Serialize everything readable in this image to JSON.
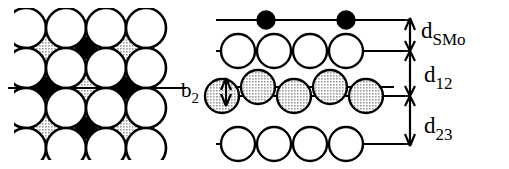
{
  "figure": {
    "kind": "crystal-surface-structure-diagram",
    "panels": [
      {
        "id": "top-view",
        "name": "top-view-panel",
        "description": "Top view of surface lattice: large open substrate circles with smaller octagonal adatom sites, some shaded gray and some filled black.",
        "rows": 5,
        "columns": 4,
        "cross_section_line": true
      },
      {
        "id": "side-view",
        "name": "side-view-panel",
        "description": "Side view cross-section showing four atomic layers with interlayer spacings and a buckled third layer.",
        "layers": [
          {
            "index": 1,
            "name": "sulfur-adatom-layer",
            "atom_style": "filled-black",
            "atom_count": 2,
            "buckled": false
          },
          {
            "index": 2,
            "name": "first-substrate-layer",
            "atom_style": "open-white",
            "atom_count": 4,
            "buckled": false
          },
          {
            "index": 3,
            "name": "second-substrate-layer",
            "atom_style": "shaded-gray",
            "atom_count": 5,
            "buckled": true
          },
          {
            "index": 4,
            "name": "third-substrate-layer",
            "atom_style": "open-white",
            "atom_count": 4,
            "buckled": false
          }
        ]
      }
    ]
  },
  "labels": {
    "d_smo": {
      "base": "d",
      "sub": "SMo",
      "full": "d_SMo",
      "meaning": "sulfur to molybdenum interlayer spacing"
    },
    "d_12": {
      "base": "d",
      "sub": "12",
      "full": "d_12",
      "meaning": "spacing between first and second substrate layers"
    },
    "d_23": {
      "base": "d",
      "sub": "23",
      "full": "d_23",
      "meaning": "spacing between second and third substrate layers"
    },
    "b_2": {
      "base": "b",
      "sub": "2",
      "full": "b_2",
      "meaning": "buckling amplitude of the second substrate layer"
    }
  },
  "colors": {
    "stroke": "#000000",
    "open_fill": "#ffffff",
    "shaded_fill": "#b4b4b4",
    "filled_fill": "#000000",
    "background": "#ffffff"
  },
  "geometry": {
    "width": 509,
    "height": 169,
    "atom_radius_large": 18,
    "atom_radius_small": 13,
    "atom_radius_black": 9
  }
}
